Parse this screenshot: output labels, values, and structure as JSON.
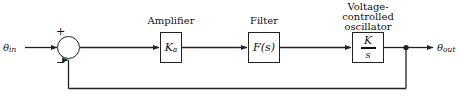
{
  "diagram": {
    "background_color": "#ffffff",
    "line_color": "#222222",
    "text_color": "#111111",
    "input": {
      "label_base": "θ",
      "label_sub": "in"
    },
    "output": {
      "label_base": "θ",
      "label_sub": "out"
    },
    "summing_junction": {
      "name": "summing-junction",
      "plus_sign": "+",
      "minus_sign": "−"
    },
    "blocks": [
      {
        "id": "amplifier",
        "caption": "Amplifier",
        "body_base": "K",
        "body_sub": "a"
      },
      {
        "id": "filter",
        "caption": "Filter",
        "body_base": "F(s)"
      },
      {
        "id": "vco",
        "caption": "Voltage-controlled oscillator",
        "caption_line1": "Voltage-",
        "caption_line2": "controlled",
        "caption_line3": "oscillator",
        "numerator": "K",
        "denominator": "s"
      }
    ],
    "feedback_path": {
      "name": "feedback-path",
      "description": "unity feedback from output node to summing junction"
    }
  }
}
